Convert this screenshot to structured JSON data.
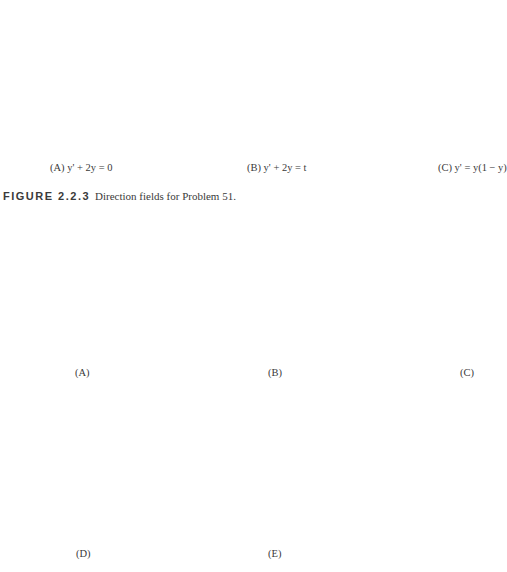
{
  "figure_caption": {
    "number": "FIGURE 2.2.3",
    "text": "Direction fields for Problem 51."
  },
  "chart_data": [
    {
      "type": "direction-field",
      "id": "top-A",
      "caption": "(A) y' + 2y = 0",
      "equation": "y' = -2y",
      "xlabel": "t",
      "ylabel": "y",
      "xlim": [
        -1,
        3
      ],
      "ylim": [
        -1,
        2
      ],
      "tick_labels": {
        "xmin": "−1",
        "xmax": "3",
        "ymin": "−1",
        "ymax": "2"
      },
      "grid_cols": 22,
      "grid_rows": 20
    },
    {
      "type": "direction-field",
      "id": "top-B",
      "caption": "(B) y' + 2y = t",
      "equation": "y' = t - 2y",
      "xlabel": "t",
      "ylabel": "y",
      "xlim": [
        -1,
        3
      ],
      "ylim": [
        -1,
        2
      ],
      "tick_labels": {
        "xmin": "−1",
        "xmax": "3",
        "ymin": "−1",
        "ymax": "2"
      },
      "grid_cols": 22,
      "grid_rows": 20
    },
    {
      "type": "direction-field",
      "id": "top-C",
      "caption": "(C) y' = y(1 − y)",
      "equation": "y' = y(1 - y)",
      "xlabel": "t",
      "ylabel": "y",
      "xlim": [
        -1,
        3
      ],
      "ylim": [
        -1,
        2
      ],
      "tick_labels": {
        "xmin": "−1",
        "xmax": "3",
        "ymin": "−1",
        "ymax": "2"
      },
      "grid_cols": 22,
      "grid_rows": 20
    },
    {
      "type": "direction-field",
      "id": "mid-A",
      "caption": "(A)",
      "equation": "y' = 0.3(y - 0.5)",
      "xlabel": "t",
      "ylabel": "y",
      "xlim": [
        -4,
        4
      ],
      "ylim": [
        -4,
        4
      ],
      "tick_labels": {
        "xmin": "−4",
        "xmax": "4",
        "ymin": "−4",
        "ymax": "4"
      },
      "grid_cols": 22,
      "grid_rows": 22
    },
    {
      "type": "direction-field",
      "id": "mid-B",
      "caption": "(B)",
      "equation": "y' = 0.5(y^2 - 4)",
      "xlabel": "t",
      "ylabel": "y",
      "xlim": [
        -4,
        4
      ],
      "ylim": [
        -4,
        4
      ],
      "tick_labels": {
        "xmin": "−4",
        "xmax": "4",
        "ymin": "−4",
        "ymax": "4"
      },
      "grid_cols": 22,
      "grid_rows": 22
    },
    {
      "type": "direction-field",
      "id": "mid-C",
      "caption": "(C)",
      "equation": "y' = t + y",
      "xlabel": "t",
      "ylabel": "y",
      "xlim": [
        -4,
        4
      ],
      "ylim": [
        -4,
        4
      ],
      "tick_labels": {
        "xmin": "−4",
        "xmax": "4",
        "ymin": "−4",
        "ymax": "4"
      },
      "grid_cols": 22,
      "grid_rows": 22
    },
    {
      "type": "direction-field",
      "id": "bot-D",
      "caption": "(D)",
      "equation": "y' = t*y",
      "xlabel": "t",
      "ylabel": "y",
      "xlim": [
        -4,
        4
      ],
      "ylim": [
        -4,
        4
      ],
      "tick_labels": {
        "xmin": "−4",
        "xmax": "4",
        "ymin": "−4",
        "ymax": "4"
      },
      "grid_cols": 22,
      "grid_rows": 22
    },
    {
      "type": "direction-field",
      "id": "bot-E",
      "caption": "(E)",
      "equation": "y' = y",
      "xlabel": "t",
      "ylabel": "y",
      "xlim": [
        -4,
        4
      ],
      "ylim": [
        -4,
        4
      ],
      "tick_labels": {
        "xmin": "−4",
        "xmax": "4",
        "ymin": "−4",
        "ymax": "4"
      },
      "grid_cols": 22,
      "grid_rows": 22
    }
  ]
}
